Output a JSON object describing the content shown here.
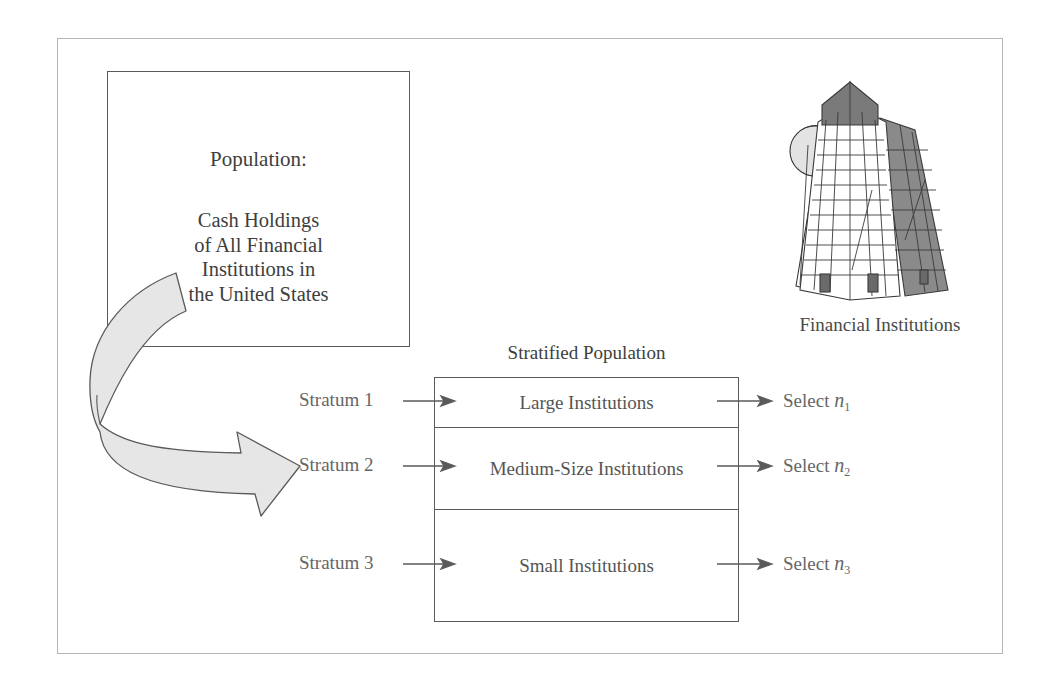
{
  "population": {
    "title": "Population:",
    "description_lines": [
      "Cash Holdings",
      "of All Financial",
      "Institutions in",
      "the United States"
    ]
  },
  "building": {
    "icon": "office-building-icon",
    "label": "Financial Institutions"
  },
  "stratified": {
    "title": "Stratified Population",
    "strata": [
      {
        "label": "Stratum 1",
        "group": "Large Institutions",
        "select_prefix": "Select",
        "sample_var": "n",
        "sample_sub": "1"
      },
      {
        "label": "Stratum 2",
        "group": "Medium-Size Institutions",
        "select_prefix": "Select",
        "sample_var": "n",
        "sample_sub": "2"
      },
      {
        "label": "Stratum 3",
        "group": "Small Institutions",
        "select_prefix": "Select",
        "sample_var": "n",
        "sample_sub": "3"
      }
    ]
  },
  "colors": {
    "stroke": "#5a5a5a",
    "arrow_fill": "#e6e6e6",
    "frame": "#b5b5b5",
    "text": "#4a4a4a",
    "building_shade": "#7a7a7a"
  }
}
